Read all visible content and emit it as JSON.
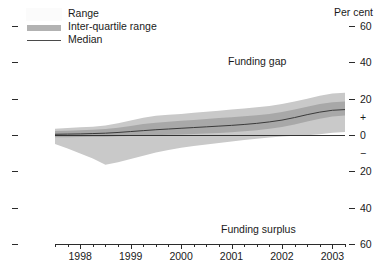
{
  "legend": {
    "items": [
      {
        "label": "Range",
        "kind": "range-swatch"
      },
      {
        "label": "Inter-quartile range",
        "kind": "iqr-swatch"
      },
      {
        "label": "Median",
        "kind": "median-line"
      }
    ]
  },
  "axis_caption": "Per cent",
  "annotations": {
    "upper": "Funding gap",
    "lower": "Funding surplus"
  },
  "chart_data": {
    "type": "area",
    "title": "",
    "subtitle": "",
    "xlabel": "",
    "ylabel": "Per cent",
    "ylim": [
      -60,
      60
    ],
    "grid": false,
    "legend_position": "top-left",
    "y_ticks": [
      60,
      40,
      20,
      0,
      -20,
      -40,
      -60
    ],
    "y_tick_labels": [
      "60",
      "40",
      "20",
      "0",
      "20",
      "40",
      "60"
    ],
    "y_sign_markers": [
      {
        "label": "+",
        "value": 10
      },
      {
        "label": "−",
        "value": -10
      }
    ],
    "x_tick_labels": [
      "1998",
      "1999",
      "2000",
      "2001",
      "2002",
      "2003"
    ],
    "x_major_values": [
      1998,
      1999,
      2000,
      2001,
      2002,
      2003
    ],
    "x_minor_per_major": 4,
    "xlim": [
      1997.5,
      2003.25
    ],
    "zero_line": 0,
    "x": [
      1997.5,
      1997.75,
      1998.0,
      1998.25,
      1998.5,
      1998.75,
      1999.0,
      1999.25,
      1999.5,
      1999.75,
      2000.0,
      2000.25,
      2000.5,
      2000.75,
      2001.0,
      2001.25,
      2001.5,
      2001.75,
      2002.0,
      2002.25,
      2002.5,
      2002.75,
      2003.0,
      2003.25
    ],
    "series": [
      {
        "name": "Range",
        "type": "band",
        "color": "#c9c9c9",
        "upper": [
          3.5,
          3.8,
          4.2,
          4.6,
          5.2,
          6.4,
          8.0,
          9.5,
          10.6,
          11.2,
          11.6,
          12.2,
          12.8,
          13.4,
          14.0,
          14.6,
          15.3,
          16.0,
          17.0,
          18.4,
          20.0,
          21.6,
          22.8,
          23.2
        ],
        "lower": [
          -5.0,
          -7.4,
          -10.2,
          -13.0,
          -16.4,
          -15.0,
          -13.2,
          -11.4,
          -9.6,
          -8.2,
          -7.0,
          -6.0,
          -5.2,
          -4.4,
          -3.6,
          -2.8,
          -2.0,
          -1.4,
          -0.8,
          -0.4,
          -0.1,
          0.4,
          1.2,
          1.6
        ]
      },
      {
        "name": "Inter-quartile range",
        "type": "band",
        "color": "#a8a8a8",
        "upper": [
          2.2,
          2.4,
          2.6,
          2.9,
          3.3,
          4.0,
          5.0,
          6.0,
          6.8,
          7.3,
          7.8,
          8.3,
          8.8,
          9.3,
          9.8,
          10.3,
          10.9,
          11.6,
          12.6,
          14.0,
          15.6,
          17.0,
          18.0,
          18.4
        ],
        "lower": [
          -1.2,
          -1.2,
          -1.1,
          -1.0,
          -0.9,
          -0.7,
          -0.5,
          -0.3,
          -0.1,
          0.1,
          0.3,
          0.5,
          0.8,
          1.1,
          1.5,
          2.0,
          2.6,
          3.4,
          4.4,
          5.8,
          7.4,
          9.0,
          10.2,
          10.8
        ]
      },
      {
        "name": "Median",
        "type": "line",
        "color": "#3a3a3a",
        "values": [
          0.4,
          0.5,
          0.6,
          0.8,
          1.0,
          1.4,
          1.9,
          2.4,
          2.9,
          3.3,
          3.7,
          4.1,
          4.5,
          4.9,
          5.3,
          5.8,
          6.4,
          7.2,
          8.2,
          9.6,
          11.2,
          12.6,
          13.6,
          14.0
        ]
      }
    ]
  }
}
